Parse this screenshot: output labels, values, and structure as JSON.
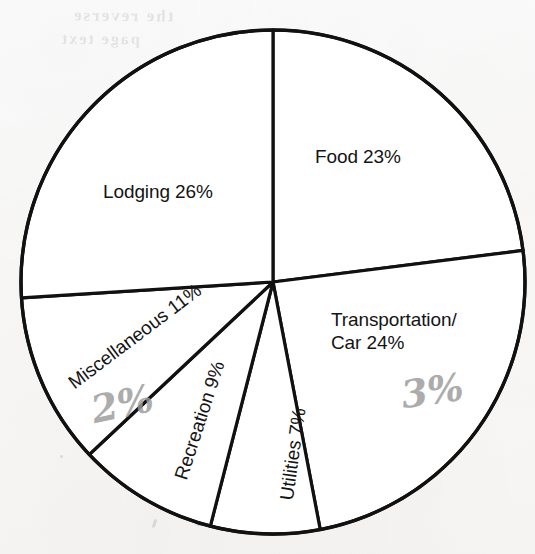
{
  "chart_data": {
    "type": "pie",
    "title": "",
    "subtitle": "",
    "xlabel": "",
    "ylabel": "",
    "legend_position": "none",
    "grid": false,
    "units": "percent",
    "total": 100,
    "start_angle_deg": 0,
    "direction": "clockwise",
    "categories": [
      "Food",
      "Transportation/Car",
      "Utilities",
      "Recreation",
      "Miscellaneous",
      "Lodging"
    ],
    "values": [
      23,
      24,
      7,
      9,
      11,
      26
    ],
    "slices": [
      {
        "id": "food",
        "name": "Food",
        "value": 23,
        "label": "Food 23%",
        "label_lines": [
          "Food 23%"
        ],
        "rotation_deg": 0,
        "fill": "#ffffff",
        "stroke": "#111111"
      },
      {
        "id": "transportation-car",
        "name": "Transportation/Car",
        "value": 24,
        "label": "Transportation/ Car 24%",
        "label_lines": [
          "Transportation/",
          "Car 24%"
        ],
        "rotation_deg": 0,
        "fill": "#ffffff",
        "stroke": "#111111"
      },
      {
        "id": "utilities",
        "name": "Utilities",
        "value": 7,
        "label": "Utilities 7%",
        "label_lines": [
          "Utilities 7%"
        ],
        "rotation_deg": -82,
        "fill": "#ffffff",
        "stroke": "#111111"
      },
      {
        "id": "recreation",
        "name": "Recreation",
        "value": 9,
        "label": "Recreation 9%",
        "label_lines": [
          "Recreation 9%"
        ],
        "rotation_deg": -72,
        "fill": "#ffffff",
        "stroke": "#111111"
      },
      {
        "id": "miscellaneous",
        "name": "Miscellaneous",
        "value": 11,
        "label": "Miscellaneous 11%",
        "label_lines": [
          "Miscellaneous 11%"
        ],
        "rotation_deg": -37,
        "fill": "#ffffff",
        "stroke": "#111111"
      },
      {
        "id": "lodging",
        "name": "Lodging",
        "value": 26,
        "label": "Lodging 26%",
        "label_lines": [
          "Lodging 26%"
        ],
        "rotation_deg": 0,
        "fill": "#ffffff",
        "stroke": "#111111"
      }
    ],
    "geometry": {
      "center_x": 273,
      "center_y": 282,
      "radius": 252
    },
    "colors": {
      "outline": "#111111",
      "slice_fill": "#ffffff",
      "label_text": "#141414",
      "pencil_annotation": "#9a9a9a",
      "paper": "#fdfdfc"
    }
  },
  "annotations": {
    "handwritten": [
      {
        "id": "pencil-misc",
        "text": "2%",
        "near": "Miscellaneous"
      },
      {
        "id": "pencil-transport",
        "text": "3%",
        "near": "Transportation/Car"
      }
    ]
  },
  "bleed_through": {
    "line_one": "the reverse",
    "line_two": "page text"
  }
}
